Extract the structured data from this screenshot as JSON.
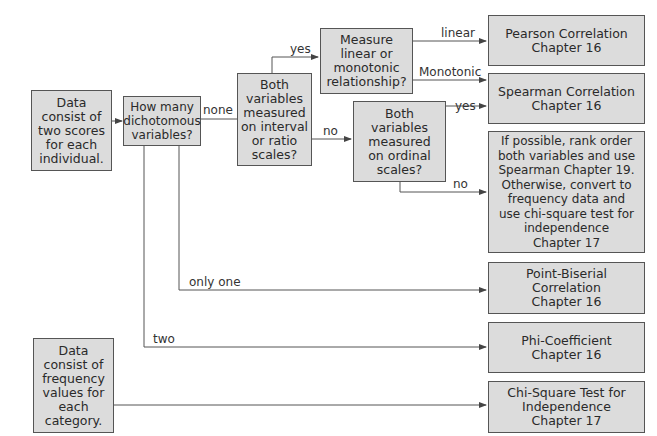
{
  "nodes": {
    "data_scores": "Data\nconsist of\ntwo scores\nfor each\nindividual.",
    "how_many": "How many\ndichotomous\nvariables?",
    "interval_ratio": "Both\nvariables\nmeasured\non interval\nor ratio\nscales?",
    "linear_monotonic": "Measure\nlinear or\nmonotonic\nrelationship?",
    "ordinal": "Both\nvariables\nmeasured\non ordinal\nscales?",
    "pearson": "Pearson Correlation\nChapter 16",
    "spearman": "Spearman Correlation\nChapter 16",
    "rank_order": "If possible, rank order\nboth variables and use\nSpearman Chapter 19.\nOtherwise, convert to\nfrequency data and\nuse chi-square test for\nindependence\nChapter 17",
    "point_biserial": "Point-Biserial\nCorrelation\nChapter 16",
    "phi": "Phi-Coefficient\nChapter 16",
    "chi_square": "Chi-Square Test for\nIndependence\nChapter 17",
    "data_frequency": "Data\nconsist of\nfrequency\nvalues for\neach\ncategory."
  },
  "edge_labels": {
    "none": "none",
    "yes_interval": "yes",
    "no_interval": "no",
    "linear": "linear",
    "monotonic": "Monotonic",
    "yes_ordinal": "yes",
    "no_ordinal": "no",
    "only_one": "only one",
    "two": "two"
  },
  "colors": {
    "box_fill": "#dcdcdc",
    "box_border": "#555555",
    "line": "#555555"
  }
}
